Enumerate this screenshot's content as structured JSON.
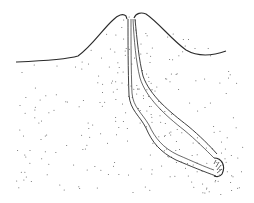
{
  "figure": {
    "colors": {
      "line": "#2a2a2a",
      "stipple": "#555555",
      "background": "#ffffff"
    }
  }
}
